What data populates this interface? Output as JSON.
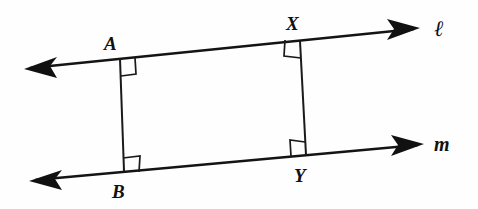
{
  "figure": {
    "kind": "geometry-diagram",
    "background_color": "#fefefe",
    "ink_color": "#141414",
    "width": 478,
    "height": 209
  },
  "lines": [
    {
      "id": "line-l",
      "label": "ℓ",
      "label_x": 434,
      "label_y": 36,
      "x1": 30,
      "y1": 68,
      "x2": 414,
      "y2": 29,
      "arrow_start": true,
      "arrow_end": true
    },
    {
      "id": "line-m",
      "label": "m",
      "label_x": 434,
      "label_y": 151,
      "x1": 35,
      "y1": 180,
      "x2": 418,
      "y2": 145,
      "arrow_start": true,
      "arrow_end": true
    }
  ],
  "segments": [
    {
      "id": "segment-AB",
      "from": "A",
      "to": "B",
      "x1": 120,
      "y1": 59,
      "x2": 124,
      "y2": 171
    },
    {
      "id": "segment-XY",
      "from": "X",
      "to": "Y",
      "x1": 300,
      "y1": 41,
      "x2": 306,
      "y2": 155
    }
  ],
  "points": [
    {
      "id": "point-A",
      "label": "A",
      "x": 120,
      "y": 59,
      "label_x": 104,
      "label_y": 50,
      "on_line": "line-l"
    },
    {
      "id": "point-X",
      "label": "X",
      "x": 300,
      "y": 41,
      "label_x": 286,
      "label_y": 30,
      "on_line": "line-l"
    },
    {
      "id": "point-B",
      "label": "B",
      "x": 124,
      "y": 171,
      "label_x": 112,
      "label_y": 198,
      "on_line": "line-m"
    },
    {
      "id": "point-Y",
      "label": "Y",
      "x": 306,
      "y": 155,
      "label_x": 294,
      "label_y": 182,
      "on_line": "line-m"
    }
  ],
  "right_angles": [
    {
      "id": "right-angle-A",
      "at": "A",
      "size": 15,
      "orientation": "lower-right"
    },
    {
      "id": "right-angle-X",
      "at": "X",
      "size": 15,
      "orientation": "lower-left"
    },
    {
      "id": "right-angle-B",
      "at": "B",
      "size": 15,
      "orientation": "upper-right"
    },
    {
      "id": "right-angle-Y",
      "at": "Y",
      "size": 15,
      "orientation": "upper-left"
    }
  ]
}
